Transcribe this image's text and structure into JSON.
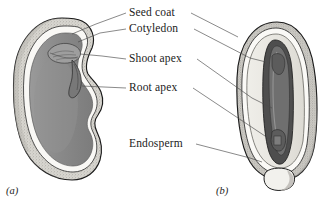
{
  "figure": {
    "kind": "botanical-diagram",
    "panels": [
      {
        "id": "a",
        "label": "(a)",
        "type": "dicot-bean-seed"
      },
      {
        "id": "b",
        "label": "(b)",
        "type": "monocot-seed"
      }
    ],
    "labels": [
      {
        "id": "seed-coat",
        "text": "Seed coat",
        "x": 129,
        "y": 16
      },
      {
        "id": "cotyledon",
        "text": "Cotyledon",
        "x": 129,
        "y": 32
      },
      {
        "id": "shoot-apex",
        "text": "Shoot apex",
        "x": 129,
        "y": 62
      },
      {
        "id": "root-apex",
        "text": "Root apex",
        "x": 129,
        "y": 91
      },
      {
        "id": "endosperm",
        "text": "Endosperm",
        "x": 129,
        "y": 147
      }
    ],
    "colors": {
      "cotyledon_gray": "#8a8a8a",
      "cotyledon_dark": "#6f6f6f",
      "seed_coat_white": "#f7f5f1",
      "endosperm_light": "#e6e4de",
      "stipple_gray": "#bdbbb5",
      "embryo_dark": "#4a4a4a",
      "outline": "#1a1a1a",
      "leader_line": "#4a4a4a",
      "text": "#1b1b1b",
      "background": "#ffffff"
    }
  }
}
